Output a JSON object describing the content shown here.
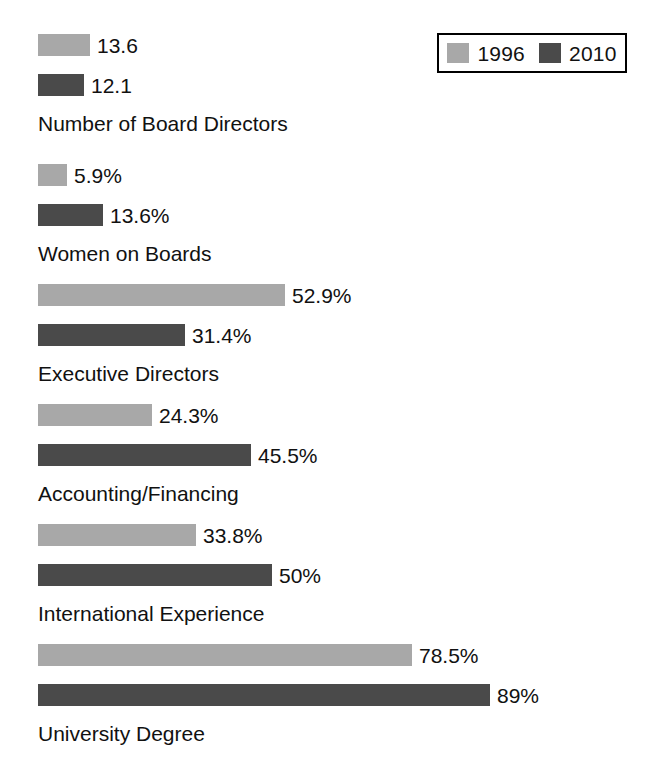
{
  "chart_data": {
    "type": "bar",
    "orientation": "horizontal",
    "title": "",
    "subtitle": "",
    "xlabel": "",
    "ylabel": "",
    "grid": false,
    "legend_position": "top-right",
    "axis_visible": false,
    "tick_labels": [],
    "xlim": [
      0,
      100
    ],
    "categories": [
      "Number of Board Directors",
      "Women on Boards",
      "Executive Directors",
      "Accounting/Financing",
      "International Experience",
      "University Degree"
    ],
    "series": [
      {
        "name": "1996",
        "color": "#a8a8a8",
        "values": [
          13.6,
          5.9,
          52.9,
          24.3,
          33.8,
          78.5
        ],
        "labels": [
          "13.6",
          "5.9%",
          "52.9%",
          "24.3%",
          "33.8%",
          "78.5%"
        ]
      },
      {
        "name": "2010",
        "color": "#4a4a4a",
        "values": [
          12.1,
          13.6,
          31.4,
          45.5,
          50,
          89
        ],
        "labels": [
          "12.1",
          "13.6%",
          "31.4%",
          "45.5%",
          "50%",
          "89%"
        ]
      }
    ]
  },
  "legend": {
    "entries": [
      {
        "label": "1996",
        "color": "#a8a8a8",
        "swatch_name": "legend-swatch-1996"
      },
      {
        "label": "2010",
        "color": "#4a4a4a",
        "swatch_name": "legend-swatch-2010"
      }
    ]
  },
  "groups": [
    {
      "label": "Number of Board Directors",
      "top": 34,
      "label_top": 113,
      "bars": [
        {
          "series": "1996",
          "label": "13.6",
          "width_px": 52,
          "row_top": 0
        },
        {
          "series": "2010",
          "label": "12.1",
          "width_px": 46,
          "row_top": 40
        }
      ]
    },
    {
      "label": "Women on Boards",
      "top": 164,
      "label_top": 243,
      "bars": [
        {
          "series": "1996",
          "label": "5.9%",
          "width_px": 29,
          "row_top": 0
        },
        {
          "series": "2010",
          "label": "13.6%",
          "width_px": 65,
          "row_top": 40
        }
      ]
    },
    {
      "label": "Executive Directors",
      "top": 284,
      "label_top": 363,
      "bars": [
        {
          "series": "1996",
          "label": "52.9%",
          "width_px": 247,
          "row_top": 0
        },
        {
          "series": "2010",
          "label": "31.4%",
          "width_px": 147,
          "row_top": 40
        }
      ]
    },
    {
      "label": "Accounting/Financing",
      "top": 404,
      "label_top": 483,
      "bars": [
        {
          "series": "1996",
          "label": "24.3%",
          "width_px": 114,
          "row_top": 0
        },
        {
          "series": "2010",
          "label": "45.5%",
          "width_px": 213,
          "row_top": 40
        }
      ]
    },
    {
      "label": "International Experience",
      "top": 524,
      "label_top": 603,
      "bars": [
        {
          "series": "1996",
          "label": "33.8%",
          "width_px": 158,
          "row_top": 0
        },
        {
          "series": "2010",
          "label": "50%",
          "width_px": 234,
          "row_top": 40
        }
      ]
    },
    {
      "label": "University Degree",
      "top": 644,
      "label_top": 723,
      "bars": [
        {
          "series": "1996",
          "label": "78.5%",
          "width_px": 374,
          "row_top": 0
        },
        {
          "series": "2010",
          "label": "89%",
          "width_px": 452,
          "row_top": 40
        }
      ]
    }
  ]
}
